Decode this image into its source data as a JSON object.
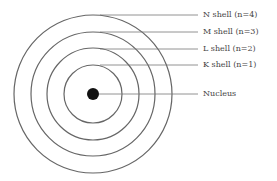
{
  "diagram": {
    "nucleus": {
      "label": "Nucleus",
      "cx": 93,
      "cy": 94,
      "r": 6
    },
    "shells": [
      {
        "label": "K shell (n=1)",
        "r": 29,
        "label_y": 65
      },
      {
        "label": "L shell (n=2)",
        "r": 46,
        "label_y": 49
      },
      {
        "label": "M shell (n=3)",
        "r": 62,
        "label_y": 32
      },
      {
        "label": "N shell (n=4)",
        "r": 79,
        "label_y": 15
      }
    ],
    "line_end_x": 198,
    "label_x": 203,
    "colors": {
      "line": "#666666",
      "nucleus": "#111111",
      "text": "#444444"
    }
  }
}
